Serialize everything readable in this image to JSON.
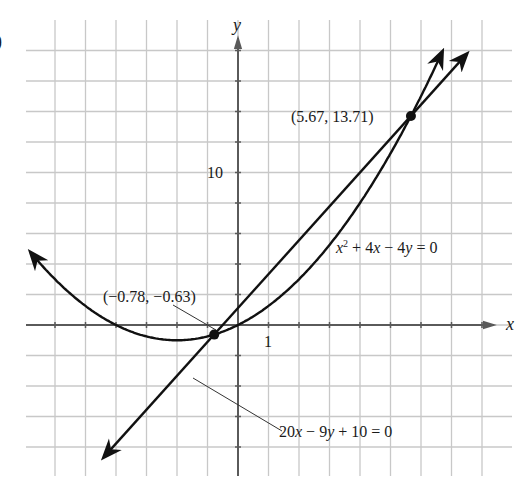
{
  "figure_marker": ")",
  "chart_data": {
    "type": "line",
    "title": "",
    "xlabel": "x",
    "ylabel": "y",
    "xlim": [
      -7,
      8
    ],
    "ylim": [
      -9,
      20
    ],
    "grid": true,
    "x_grid_step": 1,
    "y_grid_step": 2,
    "x_tick_labels": [
      {
        "value": 1,
        "label": "1"
      }
    ],
    "y_tick_labels": [
      {
        "value": 10,
        "label": "10"
      }
    ],
    "series": [
      {
        "name": "x^2 + 4x - 4y = 0",
        "kind": "parabola",
        "equation": "y = (x^2 + 4x) / 4",
        "x_range": [
          -6.8,
          6.7
        ],
        "arrows": "both"
      },
      {
        "name": "20x - 9y + 10 = 0",
        "kind": "line",
        "equation": "y = (20x + 10) / 9",
        "x_range": [
          -4.4,
          7.5
        ],
        "arrows": "both"
      }
    ],
    "points": [
      {
        "x": 5.67,
        "y": 13.71,
        "label": "(5.67, 13.71)"
      },
      {
        "x": -0.78,
        "y": -0.63,
        "label": "(−0.78, −0.63)"
      }
    ],
    "annotations": [
      {
        "text": "x² + 4x − 4y = 0",
        "target": "parabola"
      },
      {
        "text": "20x − 9y + 10 = 0",
        "target": "line"
      }
    ]
  },
  "labels": {
    "x_axis": "x",
    "y_axis": "y",
    "tick_y10": "10",
    "tick_x1": "1",
    "point_upper": "(5.67, 13.71)",
    "point_lower": "(−0.78, −0.63)",
    "eq_parabola_x": "x",
    "eq_parabola_sup": "2",
    "eq_parabola_rest1": " + 4",
    "eq_parabola_x2": "x",
    "eq_parabola_rest2": " − 4",
    "eq_parabola_y": "y",
    "eq_parabola_end": " = 0",
    "eq_line_a": "20",
    "eq_line_x": "x",
    "eq_line_b": " − 9",
    "eq_line_y": "y",
    "eq_line_c": " + 10 = 0"
  },
  "colors": {
    "grid": "#c8c8c8",
    "axis": "#5a5a5a",
    "curve": "#111111",
    "text": "#1a1a1a"
  }
}
